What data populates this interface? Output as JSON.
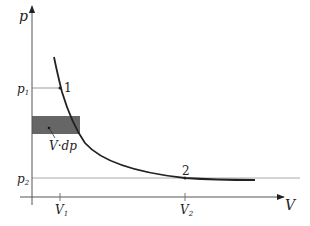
{
  "diagram": {
    "axes": {
      "y_label": "p",
      "x_label": "V"
    },
    "levels": {
      "p1": {
        "label": "p",
        "sub": "1"
      },
      "p2": {
        "label": "p",
        "sub": "2"
      }
    },
    "volumes": {
      "V1": {
        "label": "V",
        "sub": "1"
      },
      "V2": {
        "label": "V",
        "sub": "2"
      }
    },
    "points": [
      {
        "id": "1",
        "label": "1"
      },
      {
        "id": "2",
        "label": "2"
      }
    ],
    "area_label": "V·dp",
    "colors": {
      "axis": "#333333",
      "curve": "#222222",
      "guide": "#999999",
      "shade": "#666666"
    }
  }
}
